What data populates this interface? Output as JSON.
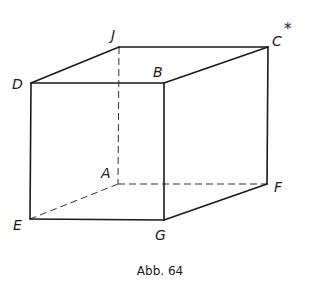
{
  "figure": {
    "type": "cube-oblique-projection",
    "caption": "Abb. 64",
    "vertices": {
      "D": {
        "label": "D",
        "x": 31,
        "y": 83
      },
      "J": {
        "label": "J",
        "x": 119,
        "y": 47
      },
      "C": {
        "label": "C",
        "x": 268,
        "y": 47,
        "superscript": "*"
      },
      "B": {
        "label": "B",
        "x": 164,
        "y": 83
      },
      "E": {
        "label": "E",
        "x": 30,
        "y": 219
      },
      "G": {
        "label": "G",
        "x": 164,
        "y": 220
      },
      "A": {
        "label": "A",
        "x": 118,
        "y": 184
      },
      "F": {
        "label": "F",
        "x": 267,
        "y": 184
      }
    },
    "visible_edges": [
      "D-J",
      "J-C",
      "D-B",
      "B-C",
      "D-E",
      "B-G",
      "C-F",
      "E-G",
      "G-F"
    ],
    "hidden_edges": [
      "J-A",
      "A-E",
      "A-F"
    ],
    "line_color": "#1a1a1a",
    "background": "#ffffff"
  }
}
